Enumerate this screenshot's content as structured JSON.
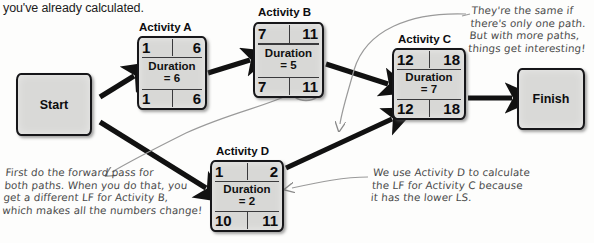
{
  "intro": {
    "text": "you've already calculated."
  },
  "terminals": [
    {
      "name": "start",
      "label": "Start"
    },
    {
      "name": "finish",
      "label": "Finish"
    }
  ],
  "nodes": [
    {
      "id": "a",
      "title": "Activity A",
      "es": "1",
      "ef": "6",
      "ls": "1",
      "lf": "6",
      "duration_line1": "Duration",
      "duration_line2": "= 6",
      "duration_value": 6,
      "circled": false
    },
    {
      "id": "b",
      "title": "Activity B",
      "es": "7",
      "ef": "11",
      "ls": "7",
      "lf": "11",
      "duration_line1": "Duration",
      "duration_line2": "= 5",
      "duration_value": 5,
      "circled": true
    },
    {
      "id": "c",
      "title": "Activity C",
      "es": "12",
      "ef": "18",
      "ls": "12",
      "lf": "18",
      "duration_line1": "Duration",
      "duration_line2": "= 7",
      "duration_value": 7,
      "circled": false
    },
    {
      "id": "d",
      "title": "Activity D",
      "es": "1",
      "ef": "2",
      "ls": "10",
      "lf": "11",
      "duration_line1": "Duration",
      "duration_line2": "= 2",
      "duration_value": 2,
      "circled": false
    }
  ],
  "annotations": [
    {
      "name": "annotation-forward-pass",
      "text": "First do the forward pass for\nboth paths. When you do that, you\nget a different LF for Activity B,\nwhich makes all the numbers change!"
    },
    {
      "name": "annotation-same-if-one-path",
      "text": "They're the same if\nthere's only one path.\nBut with more paths,\nthings get interesting!"
    },
    {
      "name": "annotation-lower-ls",
      "text": "We use Activity D to calculate\nthe LF for Activity C because\nit has the lower LS."
    }
  ],
  "colors": {
    "node_fill": "#d8d8d6",
    "node_stroke": "#17171a",
    "arrow": "#111111",
    "annotation": "#4a4a4a",
    "text": "#0d0d0f"
  }
}
